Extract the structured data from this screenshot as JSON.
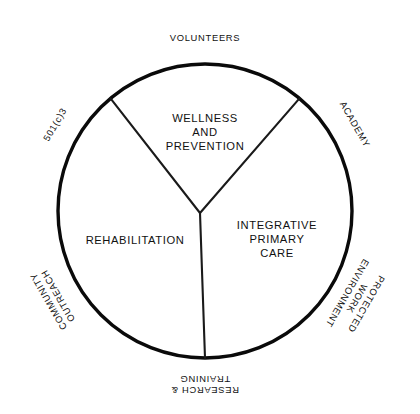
{
  "diagram": {
    "type": "flower-petal-venn",
    "title_present": false,
    "geometry": {
      "center_x": 205,
      "center_y": 211,
      "core_radius": 147,
      "petal_outer_extent": 56,
      "spoke_angles_deg": [
        130,
        50,
        270
      ],
      "petal_angles_deg": [
        90,
        30,
        330,
        270,
        210,
        150
      ]
    },
    "colors": {
      "background": "#ffffff",
      "outline": "#0a0a0a",
      "petal_outline": "#0a0a0a",
      "text": "#111111"
    },
    "core_sectors": [
      {
        "id": "wellness-and-prevention",
        "lines": [
          "WELLNESS",
          "AND",
          "PREVENTION"
        ],
        "label_x": 205,
        "label_y": 133,
        "rotation": 0
      },
      {
        "id": "integrative-primary-care",
        "lines": [
          "INTEGRATIVE",
          "PRIMARY",
          "CARE"
        ],
        "label_x": 277,
        "label_y": 240,
        "rotation": 0
      },
      {
        "id": "rehabilitation",
        "lines": [
          "REHABILITATION"
        ],
        "label_x": 135,
        "label_y": 241,
        "rotation": 0
      }
    ],
    "petals": [
      {
        "id": "volunteers",
        "lines": [
          "VOLUNTEERS"
        ],
        "angle_deg": 90,
        "rotation": 0,
        "label_radius": 172
      },
      {
        "id": "academy",
        "lines": [
          "ACADEMY"
        ],
        "angle_deg": 30,
        "rotation": 60,
        "label_radius": 172
      },
      {
        "id": "protected-work-environment",
        "lines": [
          "PROTECTED",
          "WORK",
          "ENVIRONMENT"
        ],
        "angle_deg": 330,
        "rotation": 120,
        "label_radius": 174
      },
      {
        "id": "research-and-training",
        "lines": [
          "RESEARCH &",
          "TRAINING"
        ],
        "angle_deg": 270,
        "rotation": 180,
        "label_radius": 172
      },
      {
        "id": "community-outreach",
        "lines": [
          "COMMUNITY",
          "OUTREACH"
        ],
        "angle_deg": 210,
        "rotation": 240,
        "label_radius": 174
      },
      {
        "id": "501c3",
        "lines": [
          "501(c)3"
        ],
        "angle_deg": 150,
        "rotation": 300,
        "label_radius": 172
      }
    ]
  }
}
